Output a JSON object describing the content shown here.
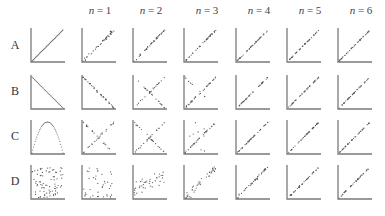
{
  "chart_data": {
    "type": "scatter",
    "title": "",
    "layout": "grid of small scatter panels, 4 rows x 7 columns, L-shaped axes, no ticks",
    "columns": [
      "",
      "n = 1",
      "n = 2",
      "n = 3",
      "n = 4",
      "n = 5",
      "n = 6"
    ],
    "rows": [
      "A",
      "B",
      "C",
      "D"
    ],
    "col_x": [
      31,
      82,
      133,
      184,
      236,
      287,
      338
    ],
    "row_y": [
      28,
      75,
      120,
      165
    ],
    "panel_size": 34,
    "panels": {
      "A": [
        "identity line (y=x)",
        "noisy increasing diagonal",
        "noisy increasing diagonal",
        "noisy increasing diagonal",
        "noisy increasing diagonal",
        "noisy increasing diagonal",
        "noisy increasing diagonal"
      ],
      "B": [
        "decreasing line (y=1-x)",
        "noisy decreasing diagonal",
        "X-shape (both diagonals)",
        "mostly increasing with residual decreasing points",
        "noisy increasing diagonal",
        "noisy increasing diagonal",
        "noisy increasing diagonal"
      ],
      "C": [
        "inverted parabola (bell)",
        "X-shape",
        "X-shape",
        "mostly increasing with residual points",
        "noisy increasing diagonal",
        "noisy increasing diagonal",
        "noisy increasing diagonal"
      ],
      "D": [
        "uniform random scatter",
        "uniform random scatter",
        "weakly increasing cloud",
        "increasing cloud",
        "noisy increasing diagonal",
        "tight increasing diagonal",
        "tight increasing diagonal"
      ]
    },
    "xlabel": "",
    "ylabel": "",
    "grid": false,
    "legend": null
  },
  "header": {
    "columns": [
      {
        "var": "n",
        "eq": " = ",
        "val": "1"
      },
      {
        "var": "n",
        "eq": " = ",
        "val": "2"
      },
      {
        "var": "n",
        "eq": " = ",
        "val": "3"
      },
      {
        "var": "n",
        "eq": " = ",
        "val": "4"
      },
      {
        "var": "n",
        "eq": " = ",
        "val": "5"
      },
      {
        "var": "n",
        "eq": " = ",
        "val": "6"
      }
    ]
  },
  "row_labels": [
    "A",
    "B",
    "C",
    "D"
  ],
  "colors": {
    "axis": "#7a7a7a",
    "point": "#555555",
    "text": "#333333"
  }
}
